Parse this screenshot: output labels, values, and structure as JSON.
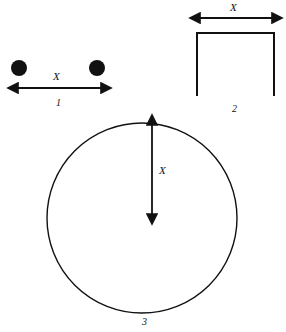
{
  "canvas": {
    "width": 286,
    "height": 332,
    "background": "#ffffff",
    "stroke_color": "#111111"
  },
  "figures": [
    {
      "id": "figure-1",
      "number_label": "1",
      "dimension_label": "X",
      "shape": "two-filled-circles",
      "description": "Two filled black dots separated horizontally with a double headed dimension arrow below",
      "dots": [
        {
          "cx": 19,
          "cy": 68,
          "r": 8
        },
        {
          "cx": 97,
          "cy": 68,
          "r": 8
        }
      ],
      "arrow": {
        "orientation": "horizontal",
        "double_headed": true,
        "x1": 17,
        "y1": 88,
        "x2": 102,
        "y2": 88
      }
    },
    {
      "id": "figure-2",
      "number_label": "2",
      "dimension_label": "X",
      "shape": "inverted-u-bracket",
      "description": "Inverted U shape, horizontal top bar with two downward legs, open at the bottom, dimension arrow above spanning the width",
      "bracket": {
        "left": 197,
        "right": 274,
        "top": 33,
        "bottom": 96
      },
      "arrow": {
        "orientation": "horizontal",
        "double_headed": true,
        "x1": 199,
        "y1": 18,
        "x2": 273,
        "y2": 18
      }
    },
    {
      "id": "figure-3",
      "number_label": "3",
      "dimension_label": "X",
      "shape": "circle-with-radius",
      "description": "Large circle outline with a vertical double headed arrow marking the radius from the top of the circle down to the center",
      "circle": {
        "cx": 142,
        "cy": 218,
        "r": 95
      },
      "arrow": {
        "orientation": "vertical",
        "double_headed": true,
        "x1": 152,
        "y1": 124,
        "x2": 152,
        "y2": 215
      }
    }
  ]
}
